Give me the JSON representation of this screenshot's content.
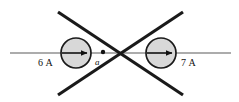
{
  "figure": {
    "background_color": "#ffffff",
    "width": 239,
    "height": 102
  },
  "labels": {
    "left_current": "6 A",
    "right_current": "7 A",
    "point": "a"
  },
  "colors": {
    "stroke": "#1a1a1a",
    "axis_line": "#5a5a5a",
    "circle_fill": "#d8d8d8",
    "circle_stroke": "#1a1a1a",
    "dot_fill": "#111111"
  },
  "geometry": {
    "horizontal_axis": {
      "x1": 10,
      "y1": 53,
      "x2": 231,
      "y2": 53
    },
    "crossing_point": {
      "x": 117,
      "y": 53
    },
    "diagonal_lines": [
      {
        "name": "top-left-to-bottom-right",
        "x1": 58,
        "y1": 12,
        "x2": 183,
        "y2": 95
      },
      {
        "name": "top-right-to-bottom-left",
        "x1": 183,
        "y1": 12,
        "x2": 58,
        "y2": 95
      }
    ],
    "left_wire_circle": {
      "cx": 76,
      "cy": 53,
      "r": 15
    },
    "right_wire_circle": {
      "cx": 161,
      "cy": 53,
      "r": 15
    },
    "left_arrow": {
      "x1": 63,
      "y1": 53,
      "x2": 88,
      "y2": 53,
      "direction": "right"
    },
    "right_arrow": {
      "x1": 148,
      "y1": 53,
      "x2": 173,
      "y2": 53,
      "direction": "right"
    },
    "point_dot": {
      "cx": 103,
      "cy": 52,
      "r": 2.1
    }
  }
}
